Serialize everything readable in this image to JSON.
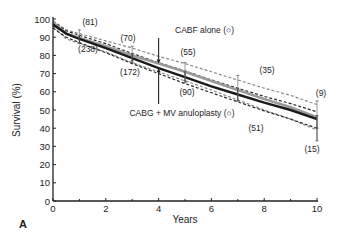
{
  "chart_data": {
    "type": "line",
    "title": "",
    "panel_label": "A",
    "xlabel": "Years",
    "ylabel": "Survival (%)",
    "xlim": [
      0,
      10
    ],
    "ylim": [
      0,
      100
    ],
    "xticks": [
      0,
      2,
      4,
      6,
      8,
      10
    ],
    "yticks": [
      0,
      10,
      20,
      30,
      40,
      50,
      60,
      70,
      80,
      90,
      100
    ],
    "grid": false,
    "legend_position": "inline annotations",
    "x": [
      0,
      0.5,
      1,
      2,
      3,
      4,
      5,
      6,
      7,
      8,
      9,
      10
    ],
    "series": [
      {
        "name": "CABF alone (○)",
        "color": "#9a9a9a",
        "style": "solid",
        "values": [
          98,
          92,
          89.5,
          85,
          80,
          75.5,
          71,
          66,
          61,
          56,
          51.5,
          46
        ],
        "ci_upper": [
          99,
          94,
          92,
          88,
          84,
          79.5,
          75.5,
          71,
          66.5,
          62,
          58,
          53
        ],
        "ci_lower": [
          96,
          89,
          86.5,
          82,
          76,
          71,
          66,
          61,
          55.5,
          50,
          45,
          39
        ],
        "at_risk": [
          {
            "x": 1,
            "y": 90,
            "n": "(81)",
            "errbar": [
              87,
              94
            ]
          },
          {
            "x": 3,
            "y": 80,
            "n": "(70)",
            "errbar": [
              77,
              85
            ]
          },
          {
            "x": 5,
            "y": 71,
            "n": "(55)",
            "errbar": [
              66,
              76
            ]
          },
          {
            "x": 7,
            "y": 61,
            "n": "(35)",
            "errbar": [
              55,
              69
            ]
          },
          {
            "x": 10,
            "y": 46,
            "n": "(9)",
            "errbar": [
              40,
              55
            ]
          }
        ]
      },
      {
        "name": "CABG + MV anuloplasty (○)",
        "color": "#1a1a1a",
        "style": "solid",
        "values": [
          97,
          92,
          89,
          84,
          78.5,
          73,
          68,
          63,
          58.5,
          54,
          50,
          45
        ],
        "ci_upper": [
          98.5,
          93.5,
          91,
          86.5,
          81,
          76,
          71.5,
          66.5,
          62,
          57.5,
          53.5,
          49
        ],
        "ci_lower": [
          95,
          90,
          87,
          81.5,
          75.5,
          70,
          64.5,
          59.5,
          54.5,
          49.5,
          45,
          40
        ],
        "at_risk": [
          {
            "x": 1,
            "y": 89,
            "n": "(238)",
            "errbar": [
              87,
              91
            ]
          },
          {
            "x": 3,
            "y": 78.5,
            "n": "(172)",
            "errbar": [
              76,
              81
            ]
          },
          {
            "x": 5,
            "y": 68,
            "n": "(90)",
            "errbar": [
              65,
              71
            ]
          },
          {
            "x": 7,
            "y": 58.5,
            "n": "(51)",
            "errbar": [
              55,
              62
            ]
          },
          {
            "x": 10,
            "y": 45,
            "n": "(15)",
            "errbar": [
              33,
              47
            ]
          }
        ]
      }
    ],
    "annotations": [
      {
        "text": "CABF alone (○)",
        "target_series": 0,
        "arrow_x": 4
      },
      {
        "text": "CABG + MV anuloplasty (○)",
        "target_series": 1,
        "arrow_x": 4
      }
    ]
  }
}
